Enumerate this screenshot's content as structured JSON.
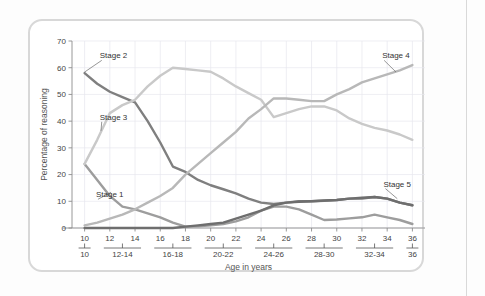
{
  "chart_data": {
    "type": "line",
    "title": "",
    "xlabel": "Age in years",
    "ylabel": "Percentage of reasoning",
    "xlim": [
      9,
      37
    ],
    "ylim": [
      0,
      70
    ],
    "ytick_values": [
      0,
      10,
      20,
      30,
      40,
      50,
      60,
      70
    ],
    "ytick_labels": [
      "0",
      "10",
      "20",
      "30",
      "40",
      "50",
      "60",
      "70"
    ],
    "xtick_values": [
      10,
      12,
      14,
      16,
      18,
      20,
      22,
      24,
      26,
      28,
      30,
      32,
      34,
      36
    ],
    "xtick_labels": [
      "10",
      "12",
      "14",
      "16",
      "18",
      "20",
      "22",
      "24",
      "26",
      "28",
      "30",
      "32",
      "34",
      "36"
    ],
    "xgroup_labels": [
      "10",
      "12-14",
      "16-18",
      "20-22",
      "24-26",
      "28-30",
      "32-34",
      "36"
    ],
    "xgroup_centers": [
      10,
      13,
      17,
      21,
      25,
      29,
      33,
      36
    ],
    "grid": true,
    "legend_position": "inline-annotations",
    "x": [
      10,
      11,
      12,
      13,
      14,
      15,
      16,
      17,
      18,
      19,
      20,
      21,
      22,
      23,
      24,
      25,
      26,
      27,
      28,
      29,
      30,
      31,
      32,
      33,
      34,
      35,
      36
    ],
    "series": [
      {
        "name": "Stage 1",
        "color": "#9d9d9d",
        "values": [
          24,
          18,
          12,
          8,
          7,
          5.5,
          4,
          2,
          0.5,
          0.6,
          1,
          1.5,
          2.5,
          4,
          6.5,
          8,
          8,
          7,
          5,
          3,
          3.2,
          3.6,
          4,
          5,
          4,
          3,
          1.5
        ]
      },
      {
        "name": "Stage 2",
        "color": "#7f7f7f",
        "values": [
          58,
          54,
          51,
          49,
          47,
          40,
          32,
          23,
          21,
          18,
          16,
          14.5,
          13,
          11,
          9.5,
          9,
          9.5,
          10,
          10,
          10.2,
          10.5,
          11,
          11,
          11.6,
          11,
          9.5,
          8.5
        ]
      },
      {
        "name": "Stage 3",
        "color": "#c9c9c9",
        "values": [
          24,
          33,
          43,
          46,
          48,
          53,
          57,
          60,
          59.5,
          59,
          58.5,
          56,
          53,
          50.5,
          48,
          41.5,
          43,
          44.5,
          45.5,
          45.5,
          44,
          41,
          39,
          37.5,
          36.5,
          35,
          33
        ]
      },
      {
        "name": "Stage 4",
        "color": "#b8b8b8",
        "values": [
          1,
          2,
          3.5,
          5,
          7,
          9.5,
          12,
          15,
          20,
          24,
          28,
          32,
          36,
          41,
          44.5,
          48.5,
          48.5,
          48,
          47.5,
          47.5,
          50,
          52,
          54.5,
          56,
          57.5,
          59,
          61
        ]
      },
      {
        "name": "Stage 5",
        "color": "#6e6e6e",
        "values": [
          0,
          0,
          0,
          0,
          0,
          0,
          0,
          0,
          0.5,
          1,
          1.5,
          2,
          3.5,
          5,
          6.5,
          8.5,
          9.5,
          9.8,
          10,
          10.3,
          10.5,
          11,
          11.3,
          11.6,
          11,
          9.5,
          8.5
        ]
      }
    ],
    "annotations": [
      {
        "label": "Stage 2",
        "x": 10,
        "y": 58,
        "text_x": 11.2,
        "text_y": 63.5
      },
      {
        "label": "Stage 3",
        "x": 11.3,
        "y": 36,
        "text_x": 11.2,
        "text_y": 40.5
      },
      {
        "label": "Stage 1",
        "x": 12.1,
        "y": 13,
        "text_x": 10.9,
        "text_y": 11.5
      },
      {
        "label": "Stage 4",
        "x": 34.7,
        "y": 58,
        "text_x": 33.6,
        "text_y": 63.5
      },
      {
        "label": "Stage 5",
        "x": 34.8,
        "y": 10.6,
        "text_x": 33.7,
        "text_y": 15.5
      }
    ]
  }
}
